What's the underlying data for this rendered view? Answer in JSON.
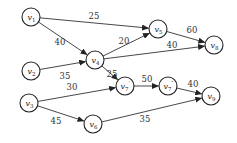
{
  "diagram": {
    "type": "directed-weighted-graph",
    "nodes": [
      {
        "id": "v1",
        "label": "v",
        "sub": "1",
        "x": 31,
        "y": 17
      },
      {
        "id": "v2",
        "label": "v",
        "sub": "2",
        "x": 31,
        "y": 71
      },
      {
        "id": "v3",
        "label": "v",
        "sub": "3",
        "x": 29,
        "y": 103
      },
      {
        "id": "v4",
        "label": "v",
        "sub": "4",
        "x": 95,
        "y": 60
      },
      {
        "id": "v5",
        "label": "v",
        "sub": "5",
        "x": 158,
        "y": 29
      },
      {
        "id": "v6",
        "label": "v",
        "sub": "6",
        "x": 93,
        "y": 124
      },
      {
        "id": "v7p",
        "label": "v",
        "sub": "7",
        "sup": "′",
        "x": 125,
        "y": 86
      },
      {
        "id": "v7pp",
        "label": "v",
        "sub": "7",
        "sup": "″",
        "x": 168,
        "y": 86
      },
      {
        "id": "v8",
        "label": "v",
        "sub": "8",
        "x": 214,
        "y": 45
      },
      {
        "id": "v9",
        "label": "v",
        "sub": "9",
        "x": 211,
        "y": 96
      }
    ],
    "edges": [
      {
        "from": "v1",
        "to": "v5",
        "weight": "25",
        "lx": 94,
        "ly": 19
      },
      {
        "from": "v1",
        "to": "v4",
        "weight": "40",
        "lx": 60,
        "ly": 45
      },
      {
        "from": "v2",
        "to": "v4",
        "weight": "35",
        "lx": 65,
        "ly": 79
      },
      {
        "from": "v4",
        "to": "v5",
        "weight": "20",
        "lx": 124,
        "ly": 44
      },
      {
        "from": "v4",
        "to": "v8",
        "weight": "40",
        "lx": 172,
        "ly": 48
      },
      {
        "from": "v4",
        "to": "v7p",
        "weight": "25",
        "lx": 112,
        "ly": 77
      },
      {
        "from": "v5",
        "to": "v8",
        "weight": "60",
        "lx": 192,
        "ly": 33
      },
      {
        "from": "v3",
        "to": "v7p",
        "weight": "30",
        "lx": 72,
        "ly": 90
      },
      {
        "from": "v3",
        "to": "v6",
        "weight": "45",
        "lx": 56,
        "ly": 124
      },
      {
        "from": "v7p",
        "to": "v7pp",
        "weight": "50",
        "lx": 147,
        "ly": 82
      },
      {
        "from": "v7pp",
        "to": "v9",
        "weight": "40",
        "lx": 193,
        "ly": 87
      },
      {
        "from": "v6",
        "to": "v9",
        "weight": "35",
        "lx": 145,
        "ly": 122
      }
    ]
  }
}
